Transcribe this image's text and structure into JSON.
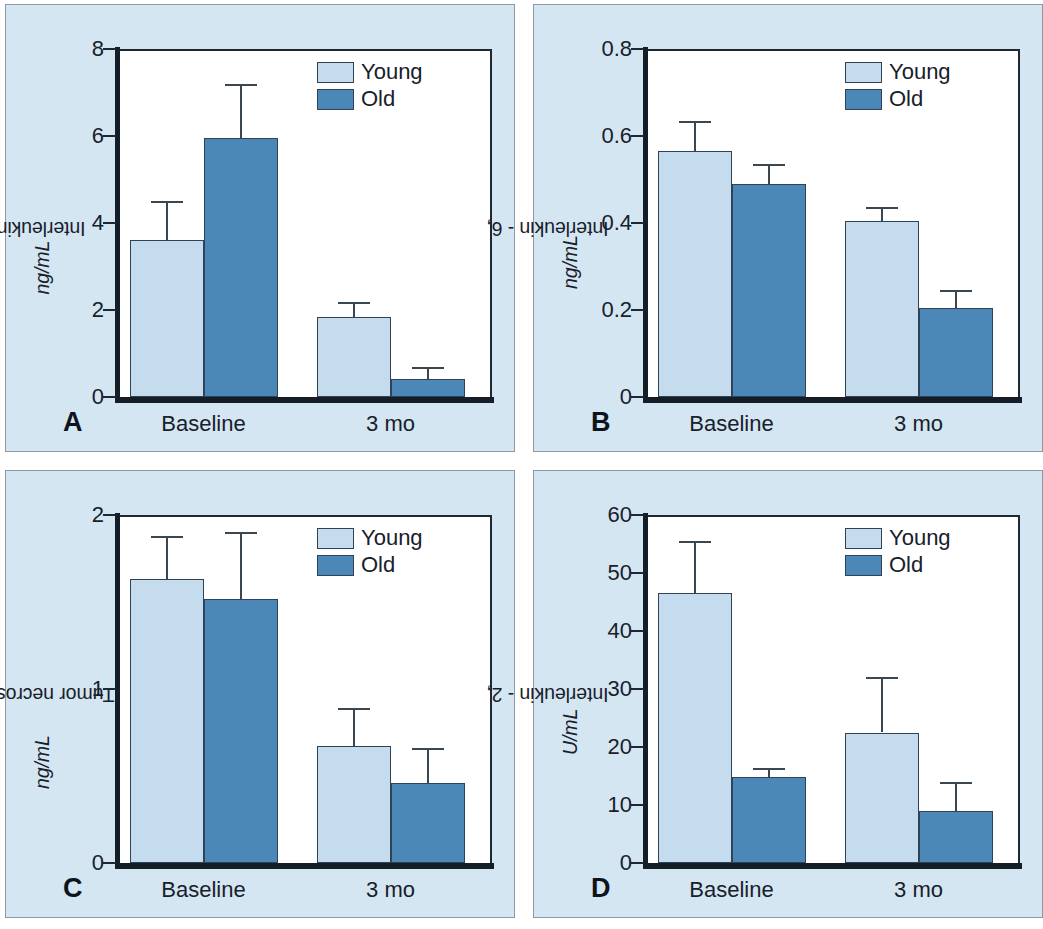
{
  "figure": {
    "background": "#ffffff",
    "panel_background": "#d4e6f2",
    "young_color": "#c5dcee",
    "old_color": "#4b88b8"
  },
  "legend": {
    "young_label": "Young",
    "old_label": "Old"
  },
  "panels": [
    {
      "letter": "A"
    },
    {
      "letter": "B"
    },
    {
      "letter": "C"
    },
    {
      "letter": "D"
    }
  ],
  "chart_data": [
    {
      "panel": "A",
      "type": "bar",
      "title": "",
      "xlabel": "",
      "ylabel": "Interleukin - 1β, ng/mL",
      "ylabel_plain": "Interleukin - 1β,",
      "ylabel_italic": "ng/mL",
      "categories": [
        "Baseline",
        "3 mo"
      ],
      "ylim": [
        0,
        8
      ],
      "yticks": [
        0,
        2,
        4,
        6,
        8
      ],
      "yticklabels": [
        "0",
        "2",
        "4",
        "6",
        "8"
      ],
      "grid": false,
      "legend_position": "top-right",
      "series": [
        {
          "name": "Young",
          "color": "#c5dcee",
          "values": [
            3.6,
            1.85
          ],
          "errors": [
            0.9,
            0.33
          ]
        },
        {
          "name": "Old",
          "color": "#4b88b8",
          "values": [
            5.95,
            0.42
          ],
          "errors": [
            1.25,
            0.28
          ]
        }
      ]
    },
    {
      "panel": "B",
      "type": "bar",
      "title": "",
      "xlabel": "",
      "ylabel": "Interleukin - 6, ng/mL",
      "ylabel_plain": "Interleukin - 6,",
      "ylabel_italic": "ng/mL",
      "categories": [
        "Baseline",
        "3 mo"
      ],
      "ylim": [
        0,
        0.8
      ],
      "yticks": [
        0,
        0.2,
        0.4,
        0.6,
        0.8
      ],
      "yticklabels": [
        "0",
        "0.2",
        "0.4",
        "0.6",
        "0.8"
      ],
      "grid": false,
      "legend_position": "top-right",
      "series": [
        {
          "name": "Young",
          "color": "#c5dcee",
          "values": [
            0.565,
            0.405
          ],
          "errors": [
            0.07,
            0.032
          ]
        },
        {
          "name": "Old",
          "color": "#4b88b8",
          "values": [
            0.49,
            0.205
          ],
          "errors": [
            0.045,
            0.042
          ]
        }
      ]
    },
    {
      "panel": "C",
      "type": "bar",
      "title": "",
      "xlabel": "",
      "ylabel": "Tumor necrosis factor, ng/mL",
      "ylabel_plain": "Tumor necrosis factor,",
      "ylabel_italic": "ng/mL",
      "categories": [
        "Baseline",
        "3 mo"
      ],
      "ylim": [
        0,
        2
      ],
      "yticks": [
        0,
        1,
        2
      ],
      "yticklabels": [
        "0",
        "1",
        "2"
      ],
      "grid": false,
      "legend_position": "top-right",
      "series": [
        {
          "name": "Young",
          "color": "#c5dcee",
          "values": [
            1.63,
            0.67
          ],
          "errors": [
            0.25,
            0.22
          ]
        },
        {
          "name": "Old",
          "color": "#4b88b8",
          "values": [
            1.52,
            0.46
          ],
          "errors": [
            0.38,
            0.2
          ]
        }
      ]
    },
    {
      "panel": "D",
      "type": "bar",
      "title": "",
      "xlabel": "",
      "ylabel": "Interleukin - 2, U/mL",
      "ylabel_plain": "Interleukin - 2,",
      "ylabel_italic": "U/mL",
      "categories": [
        "Baseline",
        "3 mo"
      ],
      "ylim": [
        0,
        60
      ],
      "yticks": [
        0,
        10,
        20,
        30,
        40,
        50,
        60
      ],
      "yticklabels": [
        "0",
        "10",
        "20",
        "30",
        "40",
        "50",
        "60"
      ],
      "grid": false,
      "legend_position": "top-right",
      "series": [
        {
          "name": "Young",
          "color": "#c5dcee",
          "values": [
            46.5,
            22.5
          ],
          "errors": [
            9.0,
            9.5
          ]
        },
        {
          "name": "Old",
          "color": "#4b88b8",
          "values": [
            14.8,
            9.0
          ],
          "errors": [
            1.6,
            5.0
          ]
        }
      ]
    }
  ]
}
